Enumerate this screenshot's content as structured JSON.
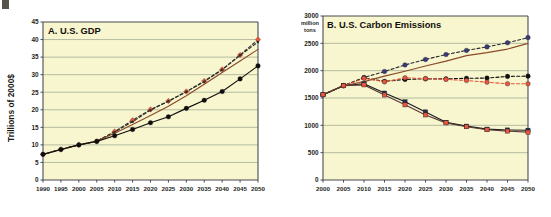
{
  "figure": {
    "background_color": "#ffffff",
    "plot_background_color": "#f7f6cf",
    "gridline_color": "#9aa38c",
    "axis_color": "#4b4b52",
    "artifact_label": "scan-artifact"
  },
  "chart_data": [
    {
      "id": "panel-a",
      "type": "line",
      "title": "A. U.S. GDP",
      "xlabel": "",
      "ylabel": "Trillions of 2000$",
      "x": [
        1990,
        1995,
        2000,
        2005,
        2010,
        2015,
        2020,
        2025,
        2030,
        2035,
        2040,
        2045,
        2050
      ],
      "xlim": [
        1990,
        2050
      ],
      "ylim": [
        0,
        45
      ],
      "yticks": [
        0,
        5,
        10,
        15,
        20,
        25,
        30,
        35,
        40,
        45
      ],
      "xticks": [
        1990,
        1995,
        2000,
        2005,
        2010,
        2015,
        2020,
        2025,
        2030,
        2035,
        2040,
        2045,
        2050
      ],
      "grid": true,
      "legend": "none",
      "series": [
        {
          "name": "High growth (red diamonds, dashed)",
          "color": "#e8563c",
          "line_color": "#3c3a36",
          "line_style": "dashed",
          "marker": "diamond",
          "values": [
            7.3,
            8.7,
            10.0,
            11.0,
            13.8,
            17.0,
            20.1,
            22.5,
            25.2,
            28.2,
            31.5,
            35.6,
            40.0
          ]
        },
        {
          "name": "Reference (dark dashed, small markers)",
          "color": "#2f2c28",
          "line_color": "#2f2c28",
          "line_style": "dashed",
          "marker": "small-circle",
          "values": [
            7.3,
            8.7,
            10.0,
            11.1,
            13.7,
            16.6,
            19.9,
            22.4,
            25.1,
            28.0,
            31.4,
            35.5,
            39.3
          ]
        },
        {
          "name": "Moderate growth (brown solid)",
          "color": "#8a4a2a",
          "line_color": "#8a4a2a",
          "line_style": "solid",
          "marker": "none",
          "values": [
            7.3,
            8.7,
            10.0,
            11.1,
            13.3,
            15.8,
            18.4,
            21.0,
            24.0,
            27.3,
            30.6,
            33.9,
            37.2
          ]
        },
        {
          "name": "Low growth (black circles, solid)",
          "color": "#100e0c",
          "line_color": "#100e0c",
          "line_style": "solid",
          "marker": "circle",
          "values": [
            7.3,
            8.7,
            10.0,
            11.0,
            12.6,
            14.4,
            16.3,
            18.0,
            20.4,
            22.7,
            25.2,
            28.8,
            32.5
          ]
        }
      ]
    },
    {
      "id": "panel-b",
      "type": "line",
      "title": "B. U.S. Carbon Emissions",
      "xlabel": "",
      "ylabel": "million tons",
      "x": [
        2000,
        2005,
        2010,
        2015,
        2020,
        2025,
        2030,
        2035,
        2040,
        2045,
        2050
      ],
      "xlim": [
        2000,
        2050
      ],
      "ylim": [
        0,
        3000
      ],
      "yticks": [
        0,
        500,
        1000,
        1500,
        2000,
        2500,
        3000
      ],
      "xticks": [
        2000,
        2005,
        2010,
        2015,
        2020,
        2025,
        2030,
        2035,
        2040,
        2045,
        2050
      ],
      "grid": true,
      "legend": "none",
      "series": [
        {
          "name": "Business as usual (blue-violet dashed)",
          "color": "#3a3a7a",
          "line_color": "#2b2b33",
          "line_style": "dashed",
          "marker": "circle",
          "values": [
            1560,
            1725,
            1875,
            1985,
            2105,
            2205,
            2295,
            2370,
            2435,
            2510,
            2605
          ]
        },
        {
          "name": "Reference brown solid",
          "color": "#8a4a2a",
          "line_color": "#8a4a2a",
          "line_style": "solid",
          "marker": "none",
          "values": [
            1560,
            1725,
            1800,
            1900,
            1990,
            2085,
            2175,
            2275,
            2330,
            2395,
            2500
          ]
        },
        {
          "name": "Policy case A (black dashed, flat)",
          "color": "#100e0c",
          "line_color": "#100e0c",
          "line_style": "dashed",
          "marker": "circle",
          "values": [
            1560,
            1725,
            1870,
            1805,
            1840,
            1850,
            1850,
            1860,
            1865,
            1895,
            1900
          ]
        },
        {
          "name": "Policy case B (red dashed, flat)",
          "color": "#e8563c",
          "line_color": "#e8563c",
          "line_style": "dashed",
          "marker": "circle",
          "values": [
            1560,
            1725,
            1860,
            1795,
            1870,
            1855,
            1840,
            1820,
            1790,
            1760,
            1760
          ]
        },
        {
          "name": "Deep reduction A (dark square, solid)",
          "color": "#2b2b4a",
          "line_color": "#1a1a22",
          "line_style": "solid",
          "marker": "square",
          "values": [
            1560,
            1725,
            1760,
            1590,
            1430,
            1245,
            1055,
            985,
            930,
            915,
            910
          ]
        },
        {
          "name": "Deep reduction B (red-outlined, solid)",
          "color": "#e8563c",
          "line_color": "#5a3b33",
          "line_style": "solid",
          "marker": "square",
          "values": [
            1560,
            1725,
            1740,
            1555,
            1375,
            1190,
            1045,
            975,
            920,
            895,
            875
          ]
        }
      ]
    }
  ]
}
